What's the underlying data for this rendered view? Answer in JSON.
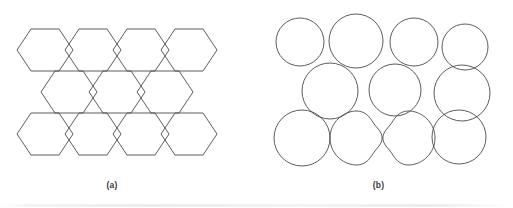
{
  "figure": {
    "background_color": "#ffffff",
    "stroke_color": "#4a4a4a",
    "stroke_width": 0.9,
    "panels": [
      {
        "id": "a",
        "caption": "(a)",
        "kind": "hexagonal-lattice",
        "description": "Regular honeycomb tiling of flat-top hexagons arranged in three rows",
        "geometry": {
          "hex_radius": 28,
          "rows": [
            {
              "row": 0,
              "count": 4,
              "center_y": 50,
              "x_centers": [
                45,
                93,
                141,
                189
              ]
            },
            {
              "row": 1,
              "count": 3,
              "center_y": 92,
              "x_centers": [
                69,
                117,
                165
              ]
            },
            {
              "row": 2,
              "count": 4,
              "center_y": 134,
              "x_centers": [
                45,
                93,
                141,
                189
              ]
            }
          ],
          "bounds": {
            "x": 21,
            "y": 22,
            "width": 197,
            "height": 146
          }
        }
      },
      {
        "id": "b",
        "caption": "(b)",
        "kind": "overlapping-circles",
        "description": "Circles of varying radius placed on the same lattice sites, overlapping and partly distorted into blobs",
        "geometry": {
          "bounds": {
            "x": 16,
            "y": 14,
            "width": 232,
            "height": 156
          },
          "circles": [
            {
              "id": "c1",
              "cx": 44,
              "cy": 42,
              "r": 24
            },
            {
              "id": "c2",
              "cx": 100,
              "cy": 41,
              "r": 27
            },
            {
              "id": "c3",
              "cx": 158,
              "cy": 42,
              "r": 24
            },
            {
              "id": "c4",
              "cx": 209,
              "cy": 47,
              "r": 23
            },
            {
              "id": "c5",
              "cx": 74,
              "cy": 91,
              "r": 28
            },
            {
              "id": "c6",
              "cx": 139,
              "cy": 90,
              "r": 26
            },
            {
              "id": "c7",
              "cx": 206,
              "cy": 93,
              "r": 28
            },
            {
              "id": "c8",
              "cx": 46,
              "cy": 138,
              "r": 28
            },
            {
              "id": "c9",
              "cx": 203,
              "cy": 137,
              "r": 27
            }
          ],
          "blobs": [
            {
              "id": "b1",
              "cx": 101,
              "cy": 138,
              "r": 27,
              "distortion": "right side indented"
            },
            {
              "id": "b2",
              "cx": 152,
              "cy": 138,
              "r": 27,
              "distortion": "left side indented"
            }
          ]
        }
      }
    ]
  }
}
